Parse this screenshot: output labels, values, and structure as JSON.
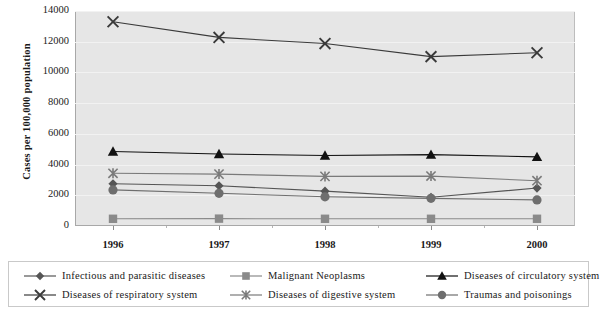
{
  "chart_data": {
    "type": "line",
    "title": "",
    "xlabel": "",
    "ylabel": "Cases per 100,000 population",
    "categories": [
      "1996",
      "1997",
      "1998",
      "1999",
      "2000"
    ],
    "x": [
      1996,
      1997,
      1998,
      1999,
      2000
    ],
    "ylim": [
      0,
      14000
    ],
    "ytick_values": [
      0,
      2000,
      4000,
      6000,
      8000,
      10000,
      12000,
      14000
    ],
    "ytick_labels": [
      "0",
      "2000",
      "4000",
      "6000",
      "8000",
      "10000",
      "12000",
      "14000"
    ],
    "grid": true,
    "legend_position": "bottom",
    "plot_background": "#e6e6e6",
    "series": [
      {
        "name": "Infectious and parasitic diseases",
        "marker": "diamond",
        "color": "#555555",
        "values": [
          2750,
          2620,
          2270,
          1870,
          2470
        ]
      },
      {
        "name": "Malignant Neoplasms",
        "marker": "square",
        "color": "#8a8a8a",
        "values": [
          470,
          480,
          470,
          470,
          470
        ]
      },
      {
        "name": "Diseases of circulatory system",
        "marker": "triangle",
        "color": "#111111",
        "values": [
          4850,
          4690,
          4590,
          4650,
          4500
        ]
      },
      {
        "name": "Diseases of respiratory system",
        "marker": "x",
        "color": "#3a3a3a",
        "values": [
          13300,
          12280,
          11880,
          11030,
          11280
        ]
      },
      {
        "name": "Diseases of digestive system",
        "marker": "asterisk",
        "color": "#7a7a7a",
        "values": [
          3430,
          3380,
          3230,
          3250,
          2950
        ]
      },
      {
        "name": "Traumas and poisonings",
        "marker": "circle",
        "color": "#6e6e6e",
        "values": [
          2350,
          2130,
          1900,
          1800,
          1700
        ]
      }
    ]
  },
  "legend": {
    "entries": [
      {
        "label": "Infectious and parasitic diseases",
        "marker": "diamond"
      },
      {
        "label": "Malignant Neoplasms",
        "marker": "square"
      },
      {
        "label": "Diseases of circulatory system",
        "marker": "triangle"
      },
      {
        "label": "Diseases of respiratory system",
        "marker": "x"
      },
      {
        "label": "Diseases of digestive system",
        "marker": "asterisk"
      },
      {
        "label": "Traumas and poisonings",
        "marker": "circle"
      }
    ]
  }
}
